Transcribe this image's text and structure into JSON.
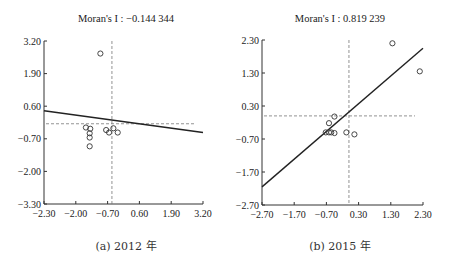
{
  "chart_data": [
    {
      "type": "scatter",
      "title": "Moran's I : −0.144 344",
      "caption": "(a) 2012 年",
      "xlabel": "",
      "ylabel": "",
      "xlim": [
        -2.3,
        3.2
      ],
      "ylim": [
        -3.3,
        3.2
      ],
      "xticks": [
        "−2.30",
        "−2.00",
        "−0.70",
        "0.60",
        "1.90",
        "3.20"
      ],
      "yticks": [
        "3.20",
        "1.90",
        "0.60",
        "−0.70",
        "−2.00",
        "−3.30"
      ],
      "xtick_values": [
        -2.3,
        -1.0,
        0.3,
        1.6,
        2.9,
        3.2
      ],
      "ytick_values": [
        3.2,
        1.9,
        0.6,
        -0.7,
        -2.0,
        -3.3
      ],
      "points": [
        {
          "x": -0.35,
          "y": 2.7
        },
        {
          "x": -0.85,
          "y": -0.25
        },
        {
          "x": -0.7,
          "y": -0.3
        },
        {
          "x": -0.72,
          "y": -0.48
        },
        {
          "x": -0.72,
          "y": -0.65
        },
        {
          "x": -0.72,
          "y": -1.0
        },
        {
          "x": -0.15,
          "y": -0.35
        },
        {
          "x": -0.05,
          "y": -0.45
        },
        {
          "x": 0.1,
          "y": -0.28
        },
        {
          "x": 0.25,
          "y": -0.45
        }
      ],
      "regression_line": {
        "x0": -2.3,
        "y0": 0.42,
        "x1": 3.2,
        "y1": -0.45
      },
      "mean_lines": {
        "x": 0.05,
        "y": -0.1
      },
      "grid": false
    },
    {
      "type": "scatter",
      "title": "Moran's I : 0.819 239",
      "caption": "(b) 2015 年",
      "xlabel": "",
      "ylabel": "",
      "xlim": [
        -2.7,
        2.3
      ],
      "ylim": [
        -2.7,
        2.3
      ],
      "xticks": [
        "−2.70",
        "−1.70",
        "−0.70",
        "0.30",
        "1.30",
        "2.30"
      ],
      "yticks": [
        "2.30",
        "1.30",
        "0.30",
        "−0.70",
        "−1.70",
        "−2.70"
      ],
      "points": [
        {
          "x": 1.35,
          "y": 2.2
        },
        {
          "x": 2.2,
          "y": 1.35
        },
        {
          "x": -0.45,
          "y": -0.02
        },
        {
          "x": -0.62,
          "y": -0.22
        },
        {
          "x": -0.72,
          "y": -0.5
        },
        {
          "x": -0.62,
          "y": -0.5
        },
        {
          "x": -0.55,
          "y": -0.5
        },
        {
          "x": -0.45,
          "y": -0.52
        },
        {
          "x": -0.08,
          "y": -0.5
        },
        {
          "x": 0.17,
          "y": -0.56
        }
      ],
      "regression_line": {
        "x0": -2.7,
        "y0": -2.15,
        "x1": 2.3,
        "y1": 2.05
      },
      "mean_lines": {
        "x": 0.0,
        "y": 0.0
      },
      "grid": false
    }
  ]
}
